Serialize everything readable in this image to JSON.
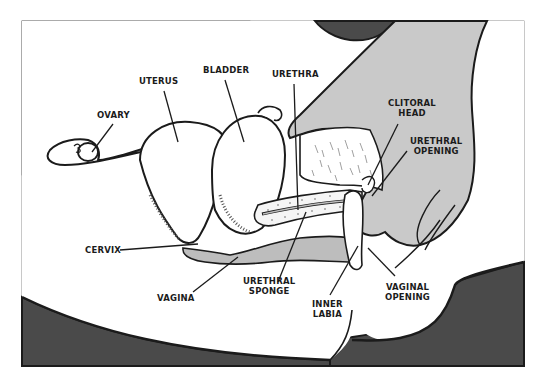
{
  "diagram": {
    "title": "",
    "labels": {
      "ovary": "OVARY",
      "uterus": "UTERUS",
      "bladder": "BLADDER",
      "urethra": "URETHRA",
      "clitoral_head_1": "CLITORAL",
      "clitoral_head_2": "HEAD",
      "urethral_opening_1": "URETHRAL",
      "urethral_opening_2": "OPENING",
      "cervix": "CERVIX",
      "vagina": "VAGINA",
      "urethral_sponge_1": "URETHRAL",
      "urethral_sponge_2": "SPONGE",
      "inner_labia_1": "INNER",
      "inner_labia_2": "LABIA",
      "vaginal_opening_1": "VAGINAL",
      "vaginal_opening_2": "OPENING"
    },
    "colors": {
      "line": "#1b1b1b",
      "skin_gray": "#c9c9c9",
      "vagina_gray": "#bdbdbd",
      "dark_fill": "#4a4a4a",
      "background": "#ffffff"
    }
  }
}
